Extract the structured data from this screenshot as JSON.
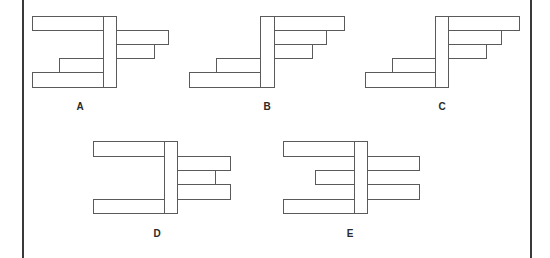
{
  "diagram": {
    "stroke_color": "#5a5a5a",
    "figures": [
      {
        "label": "A",
        "label_pos": [
          80,
          102
        ],
        "rects": [
          {
            "name": "left-bar-top",
            "x": 32,
            "y": 16,
            "w": 72,
            "h": 15
          },
          {
            "name": "right-bar-1",
            "x": 116,
            "y": 30,
            "w": 53,
            "h": 15
          },
          {
            "name": "right-bar-2",
            "x": 116,
            "y": 44,
            "w": 39,
            "h": 15
          },
          {
            "name": "left-bar-short",
            "x": 59,
            "y": 58,
            "w": 45,
            "h": 15
          },
          {
            "name": "left-bar-bottom",
            "x": 32,
            "y": 72,
            "w": 72,
            "h": 16
          },
          {
            "name": "post",
            "x": 103,
            "y": 16,
            "w": 14,
            "h": 72
          }
        ]
      },
      {
        "label": "B",
        "label_pos": [
          267,
          102
        ],
        "rects": [
          {
            "name": "right-bar-1",
            "x": 274,
            "y": 16,
            "w": 71,
            "h": 15
          },
          {
            "name": "right-bar-2",
            "x": 274,
            "y": 30,
            "w": 53,
            "h": 15
          },
          {
            "name": "right-bar-3",
            "x": 274,
            "y": 44,
            "w": 39,
            "h": 15
          },
          {
            "name": "left-bar-short",
            "x": 216,
            "y": 58,
            "w": 45,
            "h": 15
          },
          {
            "name": "left-bar-bottom",
            "x": 189,
            "y": 72,
            "w": 72,
            "h": 16
          },
          {
            "name": "post",
            "x": 260,
            "y": 16,
            "w": 15,
            "h": 72
          }
        ]
      },
      {
        "label": "C",
        "label_pos": [
          442,
          102
        ],
        "rects": [
          {
            "name": "right-bar-1",
            "x": 448,
            "y": 16,
            "w": 72,
            "h": 15
          },
          {
            "name": "right-bar-2",
            "x": 448,
            "y": 30,
            "w": 54,
            "h": 15
          },
          {
            "name": "right-bar-3",
            "x": 448,
            "y": 44,
            "w": 39,
            "h": 15
          },
          {
            "name": "left-bar-short",
            "x": 392,
            "y": 58,
            "w": 44,
            "h": 15
          },
          {
            "name": "left-bar-bottom",
            "x": 365,
            "y": 72,
            "w": 71,
            "h": 16
          },
          {
            "name": "post",
            "x": 435,
            "y": 16,
            "w": 14,
            "h": 72
          }
        ]
      },
      {
        "label": "D",
        "label_pos": [
          157,
          229
        ],
        "rects": [
          {
            "name": "left-bar-top",
            "x": 93,
            "y": 141,
            "w": 72,
            "h": 16
          },
          {
            "name": "right-bar-1",
            "x": 177,
            "y": 156,
            "w": 54,
            "h": 15
          },
          {
            "name": "right-bar-2",
            "x": 177,
            "y": 170,
            "w": 39,
            "h": 15
          },
          {
            "name": "right-bar-3",
            "x": 177,
            "y": 184,
            "w": 54,
            "h": 16
          },
          {
            "name": "left-bar-bottom",
            "x": 93,
            "y": 199,
            "w": 72,
            "h": 15
          },
          {
            "name": "post",
            "x": 164,
            "y": 141,
            "w": 14,
            "h": 73
          }
        ]
      },
      {
        "label": "E",
        "label_pos": [
          350,
          229
        ],
        "rects": [
          {
            "name": "left-bar-top",
            "x": 283,
            "y": 141,
            "w": 72,
            "h": 16
          },
          {
            "name": "right-bar-1",
            "x": 367,
            "y": 156,
            "w": 53,
            "h": 15
          },
          {
            "name": "left-bar-middle",
            "x": 315,
            "y": 170,
            "w": 40,
            "h": 15
          },
          {
            "name": "right-bar-2",
            "x": 367,
            "y": 184,
            "w": 53,
            "h": 16
          },
          {
            "name": "left-bar-bottom",
            "x": 283,
            "y": 199,
            "w": 72,
            "h": 15
          },
          {
            "name": "post",
            "x": 354,
            "y": 141,
            "w": 14,
            "h": 73
          }
        ]
      }
    ]
  },
  "frame": {
    "left_line_x": 22,
    "right_line_x": 530
  }
}
